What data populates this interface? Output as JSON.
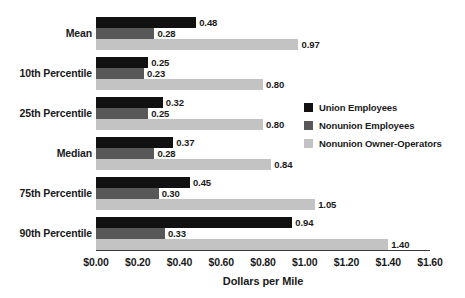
{
  "chart_data": {
    "type": "bar",
    "orientation": "horizontal",
    "title": "",
    "xlabel": "Dollars per Mile",
    "ylabel": "",
    "xlim": [
      0,
      1.6
    ],
    "grid": false,
    "legend_position": "right-middle",
    "categories": [
      "Mean",
      "10th Percentile",
      "25th Percentile",
      "Median",
      "75th Percentile",
      "90th Percentile"
    ],
    "tick_labels": [
      "$0.00",
      "$0.20",
      "$0.40",
      "$0.60",
      "$0.80",
      "$1.00",
      "$1.20",
      "$1.40",
      "$1.60"
    ],
    "tick_values": [
      0.0,
      0.2,
      0.4,
      0.6,
      0.8,
      1.0,
      1.2,
      1.4,
      1.6
    ],
    "series": [
      {
        "name": "Union Employees",
        "color": "#111111",
        "values": [
          0.48,
          0.25,
          0.32,
          0.37,
          0.45,
          0.94
        ],
        "labels": [
          "0.48",
          "0.25",
          "0.32",
          "0.37",
          "0.45",
          "0.94"
        ]
      },
      {
        "name": "Nonunion Employees",
        "color": "#585858",
        "values": [
          0.28,
          0.23,
          0.25,
          0.28,
          0.3,
          0.33
        ],
        "labels": [
          "0.28",
          "0.23",
          "0.25",
          "0.28",
          "0.30",
          "0.33"
        ]
      },
      {
        "name": "Nonunion Owner-Operators",
        "color": "#c3c3c3",
        "values": [
          0.97,
          0.8,
          0.8,
          0.84,
          1.05,
          1.4
        ],
        "labels": [
          "0.97",
          "0.80",
          "0.80",
          "0.84",
          "1.05",
          "1.40"
        ]
      }
    ]
  },
  "legend": {
    "items": [
      {
        "label": "Union Employees",
        "color": "#111111"
      },
      {
        "label": "Nonunion Employees",
        "color": "#585858"
      },
      {
        "label": "Nonunion Owner-Operators",
        "color": "#c3c3c3"
      }
    ]
  }
}
